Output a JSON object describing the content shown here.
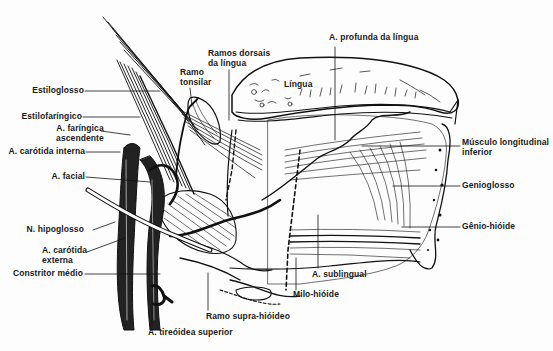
{
  "figure": {
    "colors": {
      "ink": "#111111",
      "paper": "#fdfdfd"
    }
  },
  "labels": {
    "estiloglosso": "Estiloglosso",
    "estilofaringico": "Estilofaríngico",
    "faringica_ascendente_1": "A. faríngica",
    "faringica_ascendente_2": "ascendente",
    "carotida_interna": "A. carótida interna",
    "facial": "A. facial",
    "hipoglosso": "N. hipoglosso",
    "carotida_externa_1": "A. carótida",
    "carotida_externa_2": "externa",
    "constritor_medio": "Constritor médio",
    "tireoidea_superior": "A. tireóidea superior",
    "ramo_supra_hioideo": "Ramo supra-hióideo",
    "ramo_tonsilar_1": "Ramo",
    "ramo_tonsilar_2": "tonsilar",
    "ramos_dorsais_1": "Ramos dorsais",
    "ramos_dorsais_2": "da língua",
    "lingua": "Língua",
    "profunda_lingua": "A. profunda da língua",
    "longitudinal_inferior_1": "Músculo longitudinal",
    "longitudinal_inferior_2": "inferior",
    "genioglosso": "Genioglosso",
    "genio_hioide": "Gênio-hióide",
    "sublingual": "A. sublingual",
    "milo_hioide": "Milo-hióide"
  }
}
